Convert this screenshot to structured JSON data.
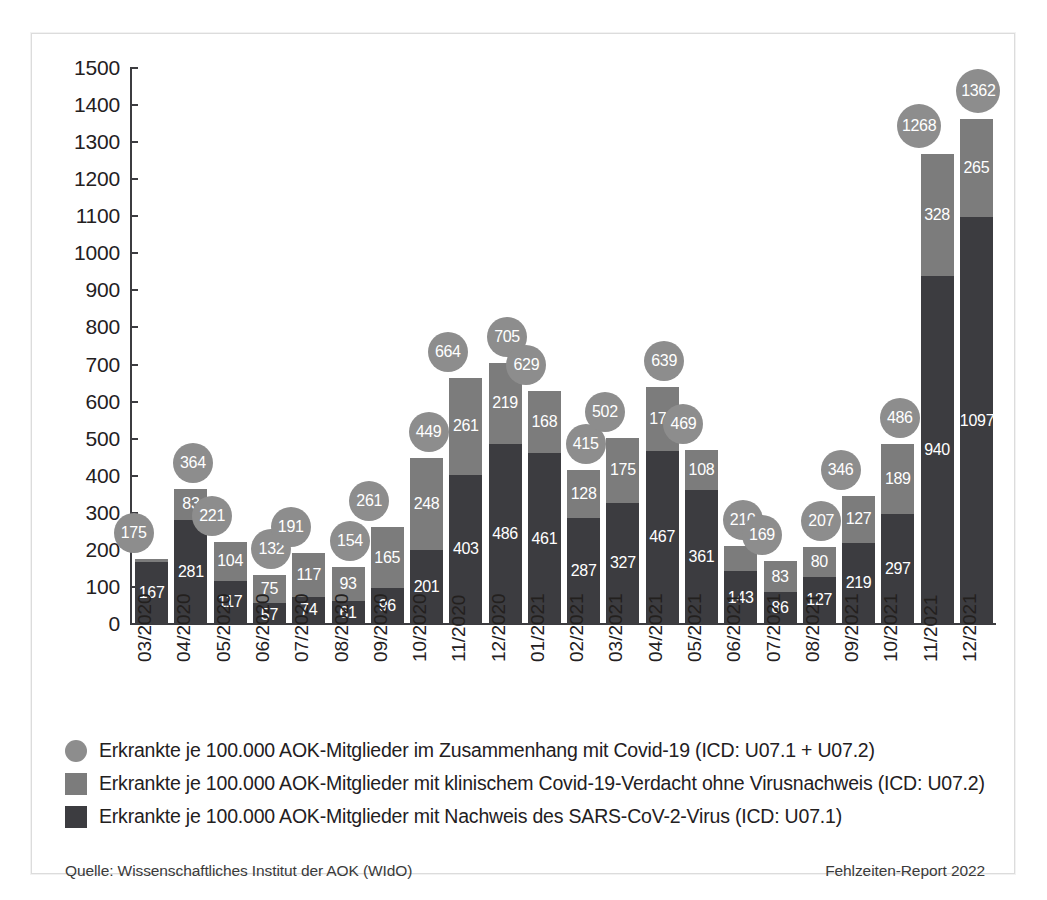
{
  "chart_data": {
    "type": "bar",
    "stacked": true,
    "title": "",
    "xlabel": "",
    "ylabel": "",
    "ylim": [
      0,
      1500
    ],
    "ytick_step": 100,
    "grid": false,
    "legend_position": "bottom",
    "categories": [
      "03/2020",
      "04/2020",
      "05/2020",
      "06/2020",
      "07/2020",
      "08/2020",
      "09/2020",
      "10/2020",
      "11/2020",
      "12/2020",
      "01/2021",
      "02/2021",
      "03/2021",
      "04/2021",
      "05/2021",
      "06/2021",
      "07/2021",
      "08/2021",
      "09/2021",
      "10/2021",
      "11/2021",
      "12/2021"
    ],
    "yticks": [
      "0",
      "100",
      "200",
      "300",
      "400",
      "500",
      "600",
      "700",
      "800",
      "900",
      "1000",
      "1100",
      "1200",
      "1300",
      "1400",
      "1500"
    ],
    "series": [
      {
        "name": "Erkrankte je 100.000 AOK-Mitglieder mit Nachweis des SARS-CoV-2-Virus (ICD: U07.1)",
        "color": "#3c3c40",
        "values": [
          167,
          281,
          117,
          57,
          74,
          61,
          96,
          201,
          403,
          486,
          461,
          287,
          327,
          467,
          361,
          143,
          86,
          127,
          219,
          297,
          940,
          1097
        ]
      },
      {
        "name": "Erkrankte je 100.000 AOK-Mitglieder mit klinischem Covid-19-Verdacht ohne Virusnachweis (ICD: U07.2)",
        "color": "#7c7c7c",
        "values": [
          8,
          83,
          104,
          75,
          117,
          93,
          165,
          248,
          261,
          219,
          168,
          128,
          175,
          172,
          108,
          67,
          83,
          80,
          127,
          189,
          328,
          265
        ]
      }
    ],
    "totals": {
      "name": "Erkrankte je 100.000 AOK-Mitglieder im Zusammenhang mit Covid-19 (ICD: U07.1 + U07.2)",
      "color": "#8d8d8d",
      "values": [
        175,
        364,
        221,
        132,
        191,
        154,
        261,
        449,
        664,
        705,
        629,
        415,
        502,
        639,
        469,
        210,
        169,
        207,
        346,
        486,
        1268,
        1362
      ]
    }
  },
  "legend": {
    "items": [
      {
        "marker": "circle-marker",
        "label": "Erkrankte je 100.000 AOK-Mitglieder im Zusammenhang mit Covid-19 (ICD: U07.1 + U07.2)"
      },
      {
        "marker": "square-light-marker",
        "label": "Erkrankte je 100.000 AOK-Mitglieder mit klinischem Covid-19-Verdacht ohne Virusnachweis (ICD: U07.2)"
      },
      {
        "marker": "square-dark-marker",
        "label": "Erkrankte je 100.000 AOK-Mitglieder mit Nachweis des SARS-CoV-2-Virus (ICD: U07.1)"
      }
    ]
  },
  "footer": {
    "source": "Quelle: Wissenschaftliches Institut der AOK (WIdO)",
    "report": "Fehlzeiten-Report 2022"
  },
  "colors": {
    "dark_segment": "#3c3c40",
    "light_segment": "#7c7c7c",
    "bubble": "#8d8d8d",
    "axis": "#3c3c40",
    "text": "#23201e",
    "frame": "#dcdcdc"
  }
}
